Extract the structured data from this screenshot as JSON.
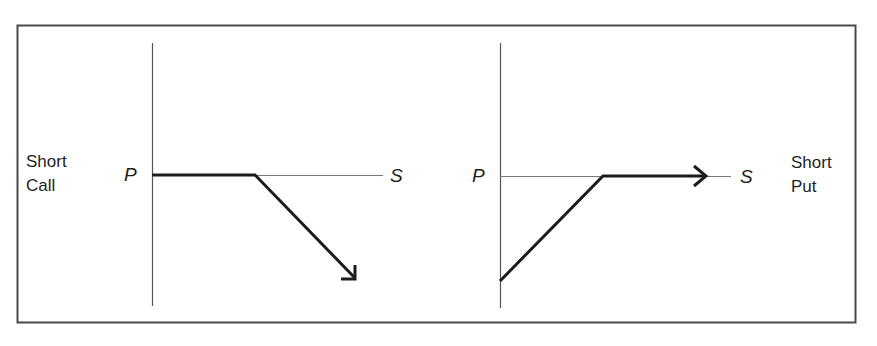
{
  "figure": {
    "frame_color": "#4a4a4a",
    "axis_color": "#555555",
    "payoff_color": "#1c1c1c"
  },
  "panels": [
    {
      "id": "short-call",
      "title_line1": "Short",
      "title_line2": "Call",
      "y_axis_label": "P",
      "x_axis_label": "S",
      "payoff_shape": "flat at premium P until strike, then declines with arrow pointing down-right"
    },
    {
      "id": "short-put",
      "title_line1": "Short",
      "title_line2": "Put",
      "y_axis_label": "P",
      "x_axis_label": "S",
      "payoff_shape": "rises from loss at S=0 to premium P at strike, then flat with arrow pointing right"
    }
  ]
}
